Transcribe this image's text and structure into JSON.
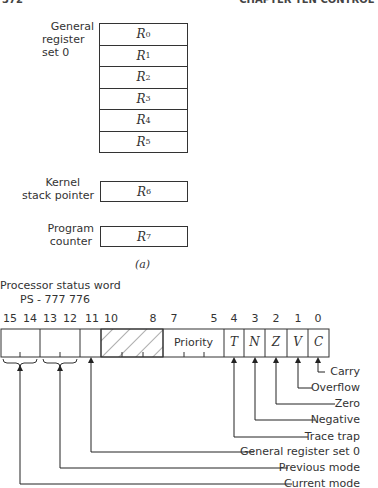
{
  "page_header": {
    "page_number": "372",
    "chapter": "CHAPTER TEN CONTROL"
  },
  "part_a": {
    "general_register_set_label": [
      "General",
      "register",
      "set 0"
    ],
    "registers": [
      {
        "name": "R",
        "sub": "0"
      },
      {
        "name": "R",
        "sub": "1"
      },
      {
        "name": "R",
        "sub": "2"
      },
      {
        "name": "R",
        "sub": "3"
      },
      {
        "name": "R",
        "sub": "4"
      },
      {
        "name": "R",
        "sub": "5"
      }
    ],
    "kernel_sp_label": [
      "Kernel",
      "stack pointer"
    ],
    "kernel_sp_register": {
      "name": "R",
      "sub": "6"
    },
    "program_counter_label": [
      "Program",
      "counter"
    ],
    "program_counter_register": {
      "name": "R",
      "sub": "7"
    },
    "caption": "(a)"
  },
  "psw": {
    "title": "Processor status word",
    "address": "PS - 777 776",
    "bit_numbers": [
      "15",
      "14",
      "13",
      "12",
      "11",
      "10",
      "8",
      "7",
      "5",
      "4",
      "3",
      "2",
      "1",
      "0"
    ],
    "fields": [
      {
        "bits": "15-14",
        "label": ""
      },
      {
        "bits": "13-12",
        "label": ""
      },
      {
        "bits": "11",
        "label": ""
      },
      {
        "bits": "10-8",
        "label": "",
        "hatched": true
      },
      {
        "bits": "7-5",
        "label": "Priority"
      },
      {
        "bits": "4",
        "label": "T"
      },
      {
        "bits": "3",
        "label": "N"
      },
      {
        "bits": "2",
        "label": "Z"
      },
      {
        "bits": "1",
        "label": "V"
      },
      {
        "bits": "0",
        "label": "C"
      }
    ],
    "legend": [
      "Carry",
      "Overflow",
      "Zero",
      "Negative",
      "Trace trap",
      "General register set 0",
      "Previous mode",
      "Current mode"
    ]
  }
}
